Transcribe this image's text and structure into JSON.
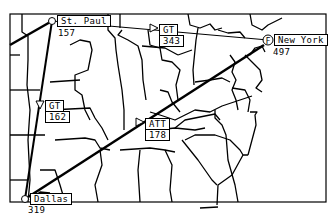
{
  "map": {
    "frame": {
      "x": 10,
      "y": 14,
      "w": 316,
      "h": 188
    },
    "colors": {
      "ink": "#000000",
      "paper": "#ffffff"
    },
    "cities": [
      {
        "id": "st-paul",
        "name": "St. Paul",
        "value": "157",
        "x": 52,
        "y": 21,
        "marker": "circle"
      },
      {
        "id": "new-york",
        "name": "New York",
        "value": "497",
        "x": 268,
        "y": 40,
        "marker": "circle-f",
        "marker_glyph": "F"
      },
      {
        "id": "dallas",
        "name": "Dallas",
        "value": "319",
        "x": 25,
        "y": 199,
        "marker": "circle"
      }
    ],
    "links": [
      {
        "id": "gt-1",
        "carrier": "GT",
        "value": "343",
        "from": "st-paul",
        "to": "new-york",
        "weight": "thin"
      },
      {
        "id": "gt-2",
        "carrier": "GT",
        "value": "162",
        "from": "st-paul",
        "to": "dallas",
        "weight": "thick"
      },
      {
        "id": "att-1",
        "carrier": "ATT",
        "value": "178",
        "from": "dallas",
        "to": "new-york",
        "weight": "thick"
      }
    ]
  }
}
